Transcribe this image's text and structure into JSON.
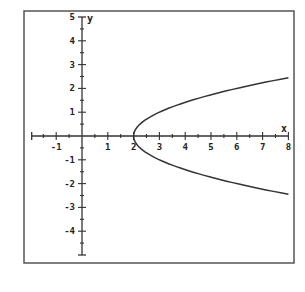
{
  "chart_data": {
    "type": "line",
    "title": "",
    "xlabel": "x",
    "ylabel": "y",
    "xlim": [
      -1.95,
      8
    ],
    "ylim": [
      -5,
      5
    ],
    "grid": false,
    "legend": null,
    "x_ticks": [
      -1,
      1,
      2,
      3,
      4,
      5,
      6,
      7,
      8
    ],
    "y_ticks": [
      5,
      4,
      3,
      2,
      1,
      -1,
      -2,
      -3,
      -4
    ],
    "x_minor_step": 0.5,
    "y_minor_step": 0.5,
    "series": [
      {
        "name": "x = y^2 + 2",
        "description": "Sideways parabola opening to the right with vertex at (2, 0)",
        "vertex": [
          2,
          0
        ],
        "x": [
          8,
          7,
          6,
          5,
          4,
          3,
          2.5,
          2.25,
          2,
          2.25,
          2.5,
          3,
          4,
          5,
          6,
          7,
          8
        ],
        "y": [
          2.449,
          2.236,
          2.0,
          1.732,
          1.414,
          1.0,
          0.707,
          0.5,
          0,
          -0.5,
          -0.707,
          -1.0,
          -1.414,
          -1.732,
          -2.0,
          -2.236,
          -2.449
        ]
      }
    ]
  },
  "colors": {
    "background": "#ffffff",
    "frame": "#555555",
    "axis": "#333333",
    "curve": "#333333"
  },
  "labels": {
    "x_axis_name": "x",
    "y_axis_name": "y",
    "x_tick_labels": [
      "-1",
      "1",
      "2",
      "3",
      "4",
      "5",
      "6",
      "7",
      "8"
    ],
    "y_tick_labels": [
      "5",
      "4",
      "3",
      "2",
      "1",
      "-1",
      "-2",
      "-3",
      "-4"
    ]
  }
}
